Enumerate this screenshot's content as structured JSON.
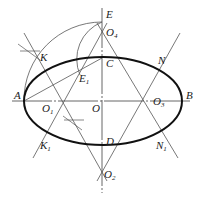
{
  "diagram": {
    "colors": {
      "line": "#444444",
      "ellipse": "#111111",
      "background": "#ffffff"
    },
    "points": {
      "A": {
        "label": "A",
        "sub": "",
        "x": 24,
        "y": 101
      },
      "B": {
        "label": "B",
        "sub": "",
        "x": 183,
        "y": 101
      },
      "O": {
        "label": "O",
        "sub": "",
        "x": 102,
        "y": 101
      },
      "C": {
        "label": "C",
        "sub": "",
        "x": 102,
        "y": 58
      },
      "D": {
        "label": "D",
        "sub": "",
        "x": 102,
        "y": 146
      },
      "E": {
        "label": "E",
        "sub": "",
        "x": 102,
        "y": 22
      },
      "E1": {
        "label": "E",
        "sub": "1",
        "x": 80,
        "y": 75
      },
      "O1": {
        "label": "O",
        "sub": "1",
        "x": 60,
        "y": 101
      },
      "O2": {
        "label": "O",
        "sub": "2",
        "x": 102,
        "y": 172
      },
      "O3": {
        "label": "O",
        "sub": "3",
        "x": 145,
        "y": 101
      },
      "O4": {
        "label": "O",
        "sub": "4",
        "x": 102,
        "y": 32
      },
      "K": {
        "label": "K",
        "sub": "",
        "x": 42,
        "y": 60
      },
      "K1": {
        "label": "K",
        "sub": "1",
        "x": 42,
        "y": 142
      },
      "N": {
        "label": "N",
        "sub": "",
        "x": 163,
        "y": 60
      },
      "N1": {
        "label": "N",
        "sub": "1",
        "x": 163,
        "y": 142
      }
    }
  }
}
